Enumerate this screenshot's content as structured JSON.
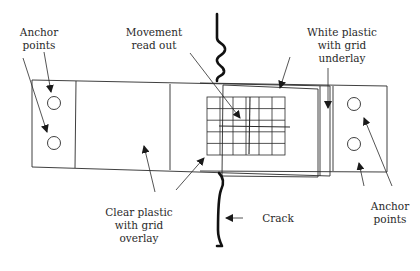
{
  "diagram": {
    "type": "crack-monitor-gauge",
    "labels": {
      "anchor_points_top_left": "Anchor\npoints",
      "movement_read_out": "Movement\nread out",
      "white_plastic": "White plastic\nwith grid\nunderlay",
      "clear_plastic": "Clear plastic\nwith grid\noverlay",
      "crack": "Crack",
      "anchor_points_bottom_right": "Anchor\npoints"
    },
    "components": [
      {
        "name": "left-anchor-tab",
        "anchor_holes": 2
      },
      {
        "name": "clear-plastic-overlay",
        "has_grid": true
      },
      {
        "name": "white-plastic-underlay",
        "has_grid": true
      },
      {
        "name": "right-anchor-tab",
        "anchor_holes": 2
      },
      {
        "name": "crack",
        "style": "thick wavy line"
      }
    ],
    "grid": {
      "columns": 6,
      "rows": 5
    },
    "colors": {
      "line": "#2a2a2a",
      "background": "#ffffff"
    }
  }
}
